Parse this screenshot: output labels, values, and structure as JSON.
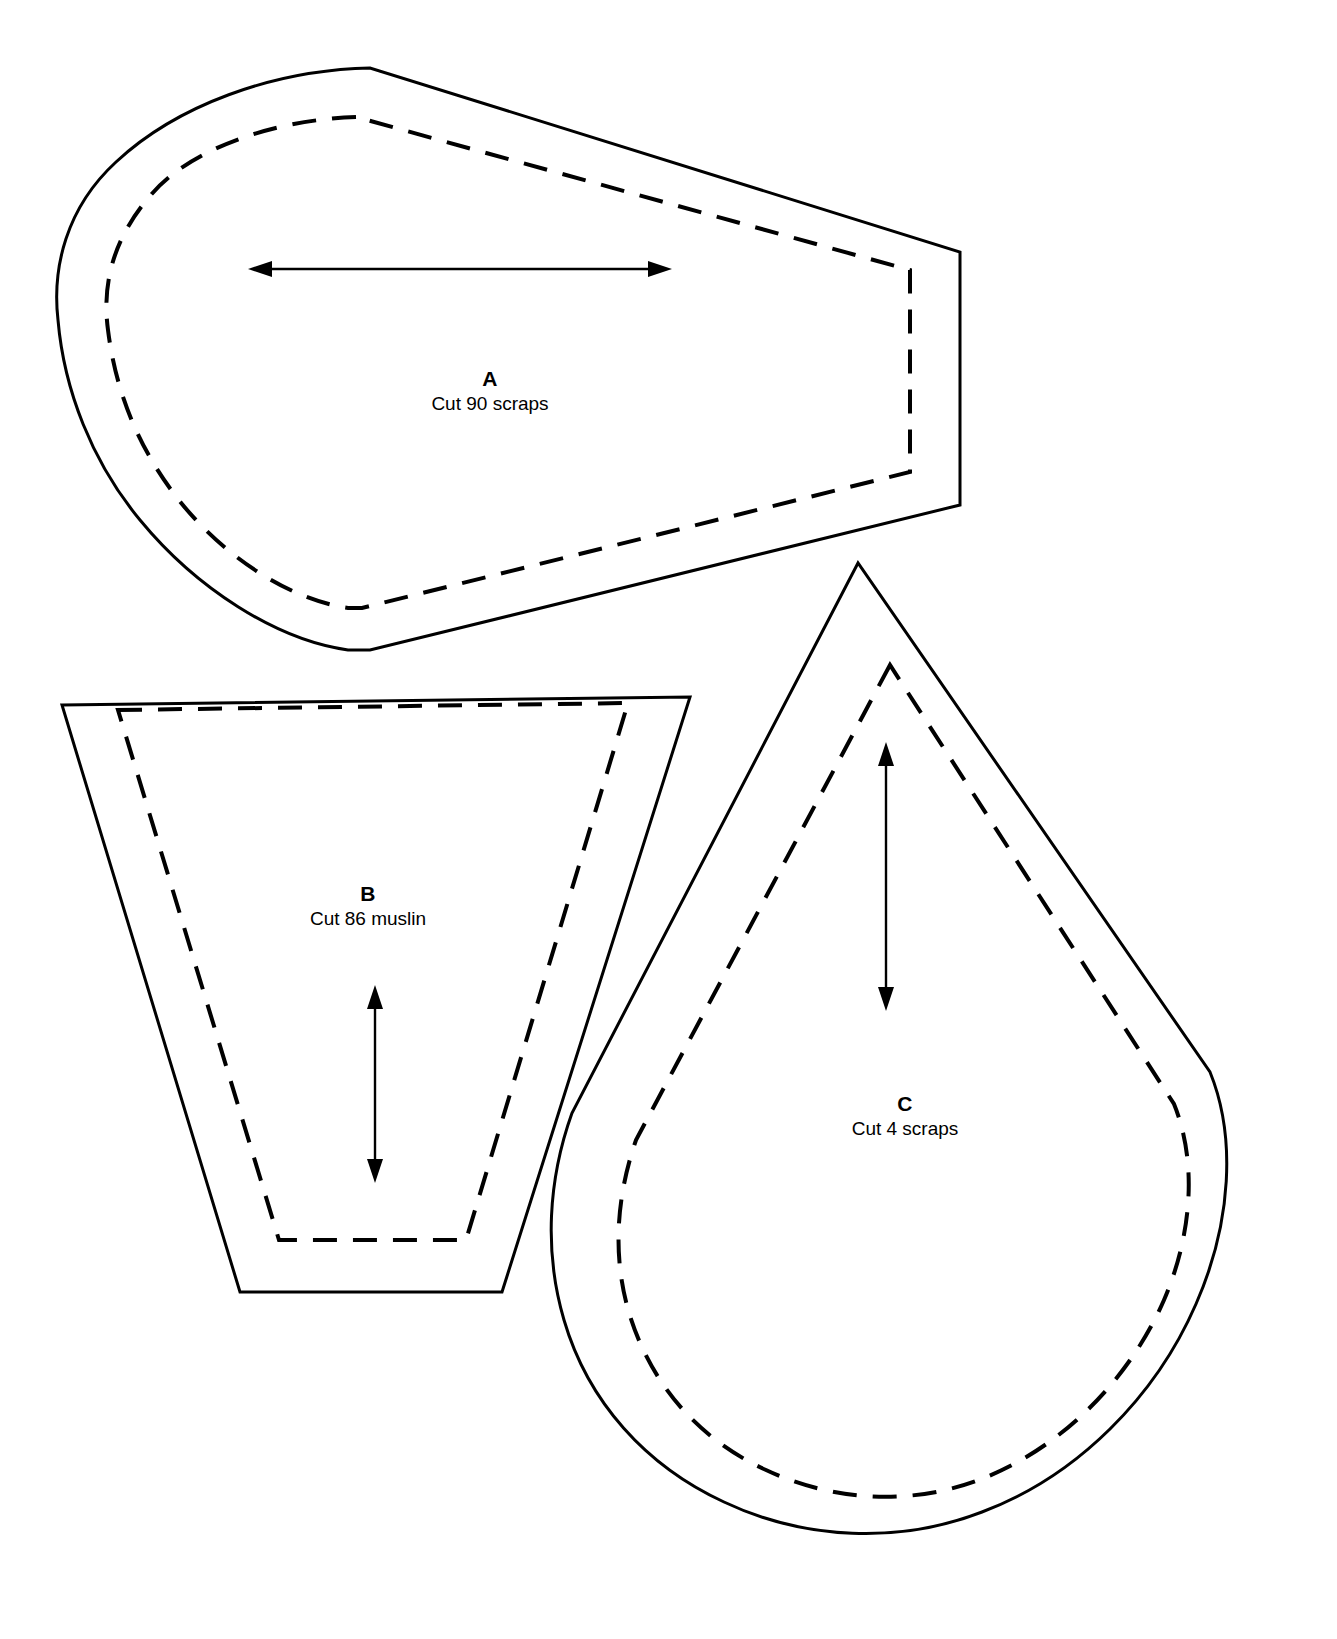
{
  "document": {
    "title": "Quilt Pattern Template Sheet",
    "background_color": "#ffffff",
    "line_color": "#000000",
    "width": 1337,
    "height": 1639
  },
  "pieces": [
    {
      "id": "a",
      "letter": "A",
      "count_label": "Cut 90 scraps",
      "quantity": 90,
      "material": "scraps",
      "shape_name": "rounded-wedge",
      "grain_direction": "horizontal-double-arrow",
      "has_seam_allowance": true
    },
    {
      "id": "b",
      "letter": "B",
      "count_label": "Cut 86 muslin",
      "quantity": 86,
      "material": "muslin",
      "shape_name": "tapered-trapezoid",
      "grain_direction": "vertical-double-arrow",
      "has_seam_allowance": true
    },
    {
      "id": "c",
      "letter": "C",
      "count_label": "Cut 4 scraps",
      "quantity": 4,
      "material": "scraps",
      "shape_name": "teardrop",
      "grain_direction": "vertical-double-arrow",
      "has_seam_allowance": true
    }
  ],
  "line_styles": {
    "cut_line": "solid",
    "seam_line": "dashed",
    "grain_line": "double-arrow"
  }
}
